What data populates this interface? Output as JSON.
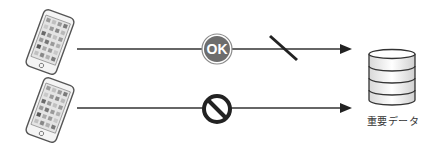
{
  "diagram": {
    "rows": [
      {
        "source": "smartphone",
        "status_icon": "ok-badge",
        "status_text": "OK",
        "line_break": true
      },
      {
        "source": "smartphone",
        "status_icon": "prohibited"
      }
    ],
    "target": {
      "icon": "database",
      "label": "重要データ"
    },
    "colors": {
      "line": "#333333",
      "ok_fill": "#6d6d6d",
      "ok_ring": "#8a8a8a",
      "prohibit": "#222222"
    }
  }
}
